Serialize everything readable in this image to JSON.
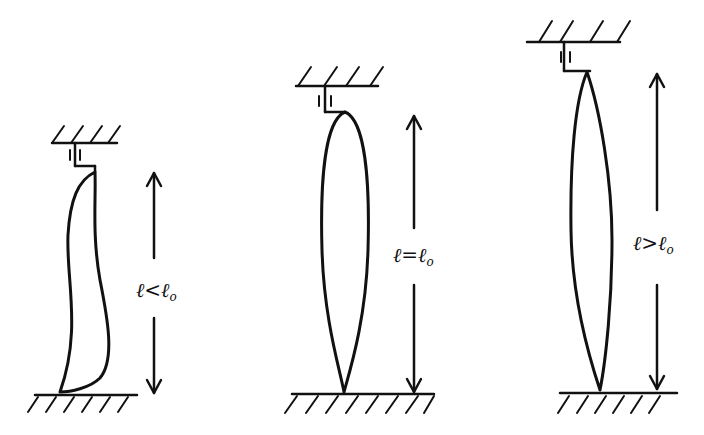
{
  "figure": {
    "ink_color": "#111111",
    "background": "#ffffff",
    "panels": [
      {
        "id": "short",
        "label_main": "ℓ<ℓ",
        "label_sub": "o",
        "relation": "less-than",
        "shape": "curved-bent"
      },
      {
        "id": "equal",
        "label_main": "ℓ=ℓ",
        "label_sub": "o",
        "relation": "equal",
        "shape": "symmetric-spindle"
      },
      {
        "id": "long",
        "label_main": "ℓ>ℓ",
        "label_sub": "o",
        "relation": "greater-than",
        "shape": "slender-spindle"
      }
    ]
  }
}
